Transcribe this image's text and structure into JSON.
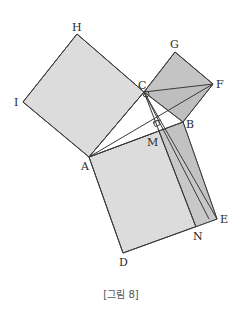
{
  "figure": {
    "caption": "[그림 8]",
    "colors": {
      "background": "#ffffff",
      "large_square_fill": "#dcdcdc",
      "medium_square_fill": "#dadada",
      "small_square_fill": "#c4c4c4",
      "strip_fill": "#c8c8c8",
      "triangle_fill": "#bdbdbd",
      "stroke": "#3a3a3a"
    },
    "points": {
      "H": {
        "label": "H",
        "x": 77,
        "y": 34
      },
      "I": {
        "label": "I",
        "x": 23,
        "y": 102
      },
      "C": {
        "label": "C",
        "x": 144,
        "y": 92
      },
      "A": {
        "label": "A",
        "x": 89,
        "y": 157
      },
      "G": {
        "label": "G",
        "x": 175,
        "y": 52
      },
      "F": {
        "label": "F",
        "x": 213,
        "y": 84
      },
      "B": {
        "label": "B",
        "x": 183,
        "y": 122
      },
      "M": {
        "label": "M",
        "x": 158,
        "y": 129
      },
      "E": {
        "label": "E",
        "x": 217,
        "y": 219
      },
      "N": {
        "label": "N",
        "x": 196,
        "y": 227
      },
      "D": {
        "label": "D",
        "x": 123,
        "y": 253
      }
    },
    "shapes": {
      "square_ACHI": "square on side AC",
      "square_BCGF": "square on side BC",
      "square_ABED": "square on hypotenuse AB",
      "rectangle_MBEN": "shaded strip from altitude foot M",
      "segments": [
        "CF",
        "AF",
        "CE",
        "CN",
        "CB"
      ]
    }
  }
}
